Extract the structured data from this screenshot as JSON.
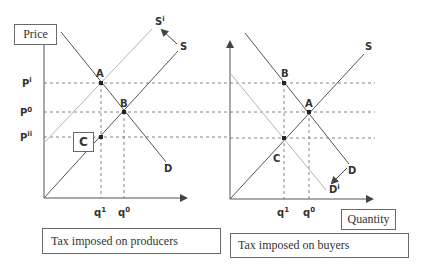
{
  "diagram": {
    "type": "supply-demand-tax-incidence",
    "colors": {
      "line": "#555555",
      "shifted_line": "#b5b5b5",
      "dashed": "#666666",
      "text": "#333333"
    },
    "left_panel": {
      "caption": "Tax imposed on producers",
      "y_axis_label": "Price",
      "price_labels": {
        "p_i": "P",
        "p_i_sup": "i",
        "p_0": "P",
        "p_0_sup": "0",
        "p_ii": "P",
        "p_ii_sup": "ii"
      },
      "quantity_labels": {
        "q_1": "q",
        "q_1_sup": "1",
        "q_0": "q",
        "q_0_sup": "0"
      },
      "points": {
        "a": "A",
        "b": "B",
        "c": "C"
      },
      "curves": {
        "supply": "S",
        "shifted_supply": "S",
        "shifted_supply_sup": "i",
        "demand": "D"
      },
      "shift_direction": "supply shifts up-left"
    },
    "right_panel": {
      "caption": "Tax imposed on buyers",
      "x_axis_label": "Quantity",
      "quantity_labels": {
        "q_1": "q",
        "q_1_sup": "1",
        "q_0": "q",
        "q_0_sup": "0"
      },
      "points": {
        "a": "A",
        "b": "B",
        "c": "C"
      },
      "curves": {
        "supply": "S",
        "demand": "D",
        "shifted_demand": "D",
        "shifted_demand_sup": "i"
      },
      "shift_direction": "demand shifts down-left"
    }
  }
}
